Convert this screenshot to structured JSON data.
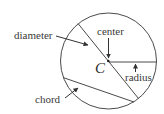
{
  "diagram": {
    "colors": {
      "stroke": "#4a4a4a",
      "text": "#3a3a3a",
      "background": "#ffffff"
    },
    "circle": {
      "cx": 108.5,
      "cy": 61,
      "r": 48
    },
    "center_point": {
      "label": "C",
      "x": 108,
      "y": 61
    },
    "labels": {
      "diameter": "diameter",
      "center": "center",
      "radius": "radius",
      "chord": "chord",
      "center_letter": "C"
    }
  }
}
